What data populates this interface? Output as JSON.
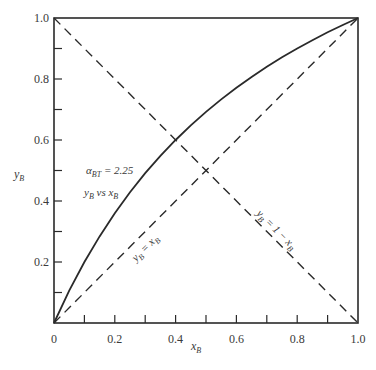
{
  "chart_data": {
    "type": "line",
    "title": "",
    "xlabel": "x_B",
    "ylabel": "y_B",
    "xlim": [
      0,
      1.0
    ],
    "ylim": [
      0,
      1.0
    ],
    "grid": false,
    "x_ticks": [
      0,
      0.1,
      0.2,
      0.3,
      0.4,
      0.5,
      0.6,
      0.7,
      0.8,
      0.9,
      1.0
    ],
    "x_tick_labels": [
      "0",
      "0.2",
      "0.4",
      "0.6",
      "0.8",
      "1.0"
    ],
    "y_ticks": [
      0,
      0.1,
      0.2,
      0.3,
      0.4,
      0.5,
      0.6,
      0.7,
      0.8,
      0.9,
      1.0
    ],
    "y_tick_labels": [
      "0.2",
      "0.4",
      "0.6",
      "0.8",
      "1.0"
    ],
    "series": [
      {
        "name": "y_B vs x_B",
        "style": "solid",
        "relative_volatility": 2.25,
        "x": [
          0,
          0.05,
          0.1,
          0.15,
          0.2,
          0.25,
          0.3,
          0.35,
          0.4,
          0.45,
          0.5,
          0.55,
          0.6,
          0.65,
          0.7,
          0.75,
          0.8,
          0.85,
          0.9,
          0.95,
          1.0
        ],
        "y": [
          0,
          0.106,
          0.2,
          0.284,
          0.36,
          0.429,
          0.491,
          0.548,
          0.6,
          0.648,
          0.692,
          0.733,
          0.771,
          0.807,
          0.84,
          0.871,
          0.9,
          0.927,
          0.953,
          0.977,
          1.0
        ]
      },
      {
        "name": "y_B = x_B",
        "style": "dashed",
        "x": [
          0,
          1.0
        ],
        "y": [
          0,
          1.0
        ]
      },
      {
        "name": "y_B = 1 − x_B",
        "style": "dashed",
        "x": [
          0,
          1.0
        ],
        "y": [
          1.0,
          0
        ]
      }
    ],
    "annotations": [
      {
        "text": "α_BT = 2.25",
        "x": 0.08,
        "y": 0.53
      },
      {
        "text": "y_B vs x_B",
        "x": 0.08,
        "y": 0.46
      },
      {
        "text": "y_B = x_B",
        "x": 0.3,
        "y": 0.25,
        "rotation": -45
      },
      {
        "text": "y_B = 1 − x_B",
        "x": 0.6,
        "y": 0.33,
        "rotation": 45
      }
    ]
  },
  "labels": {
    "xlabel_main": "x",
    "xlabel_sub": "B",
    "ylabel_main": "y",
    "ylabel_sub": "B",
    "alpha_main": "α",
    "alpha_sub": "BT",
    "alpha_value": " = 2.25",
    "curve_label": "y",
    "curve_label_sub": "B",
    "curve_label_vs": " vs x",
    "curve_label_sub2": "B",
    "diag_label": "y",
    "diag_label_sub": "B",
    "diag_label_rest": " = x",
    "diag_label_sub2": "B",
    "anti_label": "y",
    "anti_label_sub": "B",
    "anti_label_rest": " = 1 − x",
    "anti_label_sub2": "B"
  }
}
